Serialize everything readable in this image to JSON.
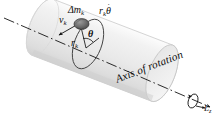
{
  "figure": {
    "background_color": "#ffffff",
    "ink_color": "#141414",
    "cylinder_fill": "#efefef",
    "cylinder_edge": "#c9c9c9",
    "particle_color": "#6b6b6b",
    "labels": {
      "mass_element": "Δm",
      "mass_element_sub": "k",
      "velocity": "v",
      "velocity_sub": "k",
      "tangential_speed": "r",
      "tangential_speed_sub": "k",
      "tangential_speed_theta": "θ",
      "tangential_speed_dot": "˙",
      "radius": "r",
      "radius_sub": "k",
      "angle": "θ",
      "axis": "Axis of rotation",
      "angular_momentum": "L",
      "angular_momentum_sub": "z"
    }
  }
}
